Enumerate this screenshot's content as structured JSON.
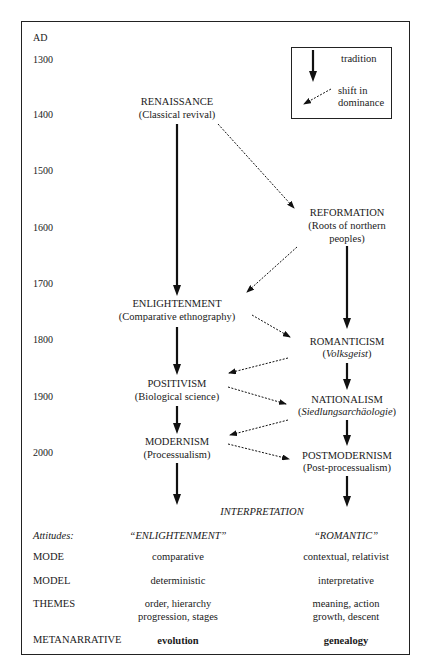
{
  "axis": {
    "label": "AD",
    "years": [
      "1300",
      "1400",
      "1500",
      "1600",
      "1700",
      "1800",
      "1900",
      "2000"
    ]
  },
  "legend": {
    "tradition": "tradition",
    "shift_line1": "shift in",
    "shift_line2": "dominance"
  },
  "left_column": [
    {
      "title": "RENAISSANCE",
      "subtitle": "(Classical revival)"
    },
    {
      "title": "ENLIGHTENMENT",
      "subtitle": "(Comparative ethnography)"
    },
    {
      "title": "POSITIVISM",
      "subtitle": "(Biological science)"
    },
    {
      "title": "MODERNISM",
      "subtitle": "(Processualism)"
    }
  ],
  "right_column": [
    {
      "title": "REFORMATION",
      "subtitle_line1": "(Roots of northern",
      "subtitle_line2": "peoples)"
    },
    {
      "title": "ROMANTICISM",
      "subtitle_open": "(",
      "subtitle_italic": "Volksgeist",
      "subtitle_close": ")"
    },
    {
      "title": "NATIONALISM",
      "subtitle_open": "(",
      "subtitle_italic": "Siedlungsarchäologie",
      "subtitle_close": ")"
    },
    {
      "title": "POSTMODERNISM",
      "subtitle": "(Post-processualism)"
    }
  ],
  "interpretation": "INTERPRETATION",
  "table": {
    "rows": [
      {
        "label": "Attitudes:",
        "left": "“ENLIGHTENMENT”",
        "right": "“ROMANTIC”"
      },
      {
        "label": "MODE",
        "left": "comparative",
        "right": "contextual, relativist"
      },
      {
        "label": "MODEL",
        "left": "deterministic",
        "right": "interpretative"
      },
      {
        "label": "THEMES",
        "left_line1": "order, hierarchy",
        "left_line2": "progression, stages",
        "right_line1": "meaning, action",
        "right_line2": "growth, descent"
      },
      {
        "label": "METANARRATIVE",
        "left": "evolution",
        "right": "genealogy"
      }
    ]
  },
  "colors": {
    "ink": "#1a1a1a",
    "frame": "#222222",
    "background": "#ffffff"
  }
}
